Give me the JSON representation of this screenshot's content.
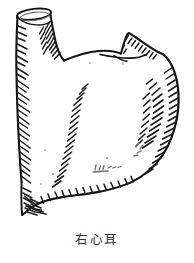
{
  "figure": {
    "caption": "右心耳",
    "medium": "ink line drawing",
    "background_color": "#ffffff",
    "ink_color": "#121212",
    "hatch_color": "#1a1a1a",
    "faint_ink_color": "#6d6d6d",
    "caption_color": "#2b2b2b",
    "parts": [
      {
        "name": "vessel-stump",
        "label": "",
        "position": "upper-left"
      },
      {
        "name": "cut-opening-rim",
        "label": "",
        "position": "top-left"
      },
      {
        "name": "appendage-body",
        "label": "",
        "position": "center"
      },
      {
        "name": "pointed-flap",
        "label": "",
        "position": "upper-right"
      },
      {
        "name": "inferior-margin",
        "label": "",
        "position": "bottom"
      },
      {
        "name": "lower-left-tip",
        "label": "",
        "position": "lower-left"
      }
    ]
  }
}
